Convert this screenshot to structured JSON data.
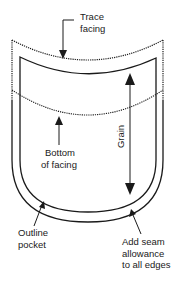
{
  "diagram": {
    "type": "sewing pattern - patch pocket with facing",
    "labels": {
      "trace_facing_1": "Trace",
      "trace_facing_2": "facing",
      "bottom_facing_1": "Bottom",
      "bottom_facing_2": "of facing",
      "grain": "Grain",
      "outline_pocket_1": "Outline",
      "outline_pocket_2": "pocket",
      "seam_allowance_1": "Add seam",
      "seam_allowance_2": "allowance",
      "seam_allowance_3": "to all edges"
    },
    "colors": {
      "stroke": "#1a1a1a",
      "background": "#ffffff"
    }
  }
}
